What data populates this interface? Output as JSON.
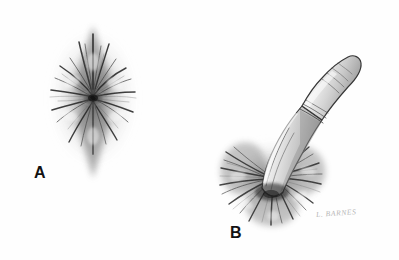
{
  "figure": {
    "medium": "graphite pencil drawing",
    "background_color": "#fefefe",
    "ink_color": "#2a2a2a",
    "width": 399,
    "height": 260
  },
  "panels": [
    {
      "id": "A",
      "label": "A",
      "description": "Radiating stellate fold pattern, closed, vertically elongated diamond shape with converging creases at the center and a thin midline raphe extending downward",
      "center_x": 93,
      "center_y": 98,
      "label_x": 34,
      "label_y": 165
    },
    {
      "id": "B",
      "label": "B",
      "description": "Same stellate structure splayed open by an examining finger inserted from the upper right; folds are stretched radially outward around the inserted digit",
      "center_x": 277,
      "center_y": 178,
      "label_x": 230,
      "label_y": 225
    }
  ],
  "signature": {
    "text": "L. BARNES",
    "color": "#b6b6b6",
    "x": 316,
    "y": 210
  },
  "colors": {
    "background": "#fefefe",
    "label_text": "#121212",
    "signature_text": "#b6b6b6",
    "graphite_dark": "#1e1e1e",
    "graphite_mid": "#6e6e6e",
    "graphite_light": "#b9b9b9",
    "skin_outline": "#3a3a3a",
    "skin_shade": "#9a9a9a"
  }
}
